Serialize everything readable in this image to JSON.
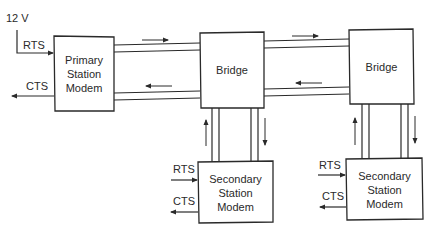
{
  "diagram": {
    "supply_label": "12 V",
    "primary": {
      "lines": [
        "Primary",
        "Station",
        "Modem"
      ],
      "rts_label": "RTS",
      "cts_label": "CTS"
    },
    "bridges": [
      {
        "label": "Bridge"
      },
      {
        "label": "Bridge"
      }
    ],
    "secondaries": [
      {
        "lines": [
          "Secondary",
          "Station",
          "Modem"
        ],
        "rts_label": "RTS",
        "cts_label": "CTS"
      },
      {
        "lines": [
          "Secondary",
          "Station",
          "Modem"
        ],
        "rts_label": "RTS",
        "cts_label": "CTS"
      }
    ],
    "stroke_color": "#2a2a2a"
  }
}
